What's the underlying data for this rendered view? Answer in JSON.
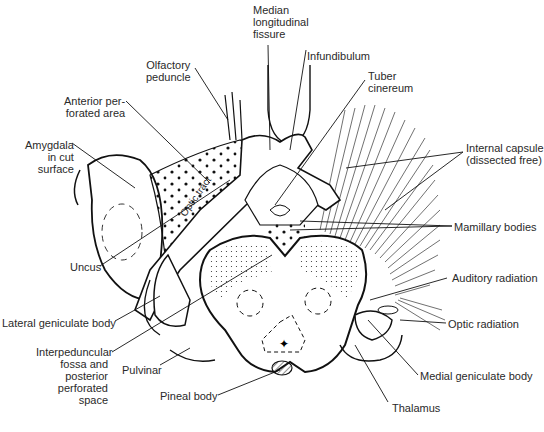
{
  "figure": {
    "labels": {
      "median_fissure": [
        "Median",
        "longitudinal",
        "fissure"
      ],
      "olfactory_peduncle": [
        "Olfactory",
        "peduncle"
      ],
      "infundibulum": "Infundibulum",
      "tuber_cinereum": [
        "Tuber",
        "cinereum"
      ],
      "anterior_perforated": [
        "Anterior per-",
        "forated area"
      ],
      "amygdala": [
        "Amygdala",
        "in cut",
        "surface"
      ],
      "internal_capsule": [
        "Internal capsule",
        "(dissected free)"
      ],
      "optic_tract": "Optic tract",
      "mamillary_bodies": "Mamillary bodies",
      "uncus": "Uncus",
      "auditory_radiation": "Auditory radiation",
      "lateral_geniculate": "Lateral geniculate body",
      "optic_radiation": "Optic radiation",
      "interpeduncular": [
        "Interpeduncular",
        "fossa and",
        "posterior",
        "perforated",
        "space"
      ],
      "pulvinar": "Pulvinar",
      "medial_geniculate": "Medial geniculate body",
      "pineal_body": "Pineal body",
      "thalamus": "Thalamus"
    },
    "colors": {
      "ink": "#1a1a1a",
      "background": "#ffffff",
      "text": "#2a2a2a"
    }
  }
}
